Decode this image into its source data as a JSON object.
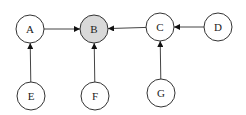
{
  "diagram": {
    "type": "directed-graph",
    "nodes": [
      {
        "id": "A",
        "label": "A",
        "x": 30,
        "y": 29,
        "highlight": false
      },
      {
        "id": "B",
        "label": "B",
        "x": 94,
        "y": 29,
        "highlight": true
      },
      {
        "id": "C",
        "label": "C",
        "x": 160,
        "y": 27,
        "highlight": false
      },
      {
        "id": "D",
        "label": "D",
        "x": 218,
        "y": 27,
        "highlight": false
      },
      {
        "id": "E",
        "label": "E",
        "x": 31,
        "y": 96,
        "highlight": false
      },
      {
        "id": "F",
        "label": "F",
        "x": 95,
        "y": 96,
        "highlight": false
      },
      {
        "id": "G",
        "label": "G",
        "x": 161,
        "y": 93,
        "highlight": false
      }
    ],
    "edges": [
      {
        "from": "A",
        "to": "B"
      },
      {
        "from": "C",
        "to": "B"
      },
      {
        "from": "D",
        "to": "C"
      },
      {
        "from": "E",
        "to": "A"
      },
      {
        "from": "F",
        "to": "B"
      },
      {
        "from": "G",
        "to": "C"
      }
    ],
    "colors": {
      "highlight_fill": "#d9d9d9",
      "node_fill": "#ffffff",
      "stroke": "#333333"
    }
  }
}
